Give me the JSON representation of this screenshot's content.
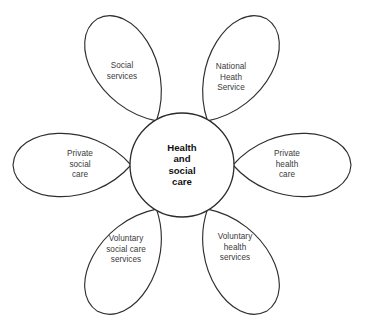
{
  "diagram": {
    "type": "petal-flower",
    "canvas": {
      "width": 365,
      "height": 317
    },
    "colors": {
      "background": "#ffffff",
      "stroke": "#2f2f2f",
      "core_stroke": "#2b2b2b",
      "petal_text": "#3a3a3a",
      "core_text": "#111111"
    },
    "core": {
      "label": "Health\nand\nsocial\ncare",
      "cx": 182,
      "cy": 165,
      "r": 52
    },
    "petals": [
      {
        "id": "social-services",
        "label": "Social\nservices",
        "angle_deg": 240,
        "label_x": 122,
        "label_y": 72,
        "length": 118,
        "width": 62
      },
      {
        "id": "national-heath-service",
        "label": "National\nHeath\nService",
        "angle_deg": 300,
        "label_x": 231,
        "label_y": 78,
        "length": 118,
        "width": 62
      },
      {
        "id": "private-social-care",
        "label": "Private\nsocial\ncare",
        "angle_deg": 180,
        "label_x": 80,
        "label_y": 165,
        "length": 118,
        "width": 62
      },
      {
        "id": "private-health-care",
        "label": "Private\nhealth\ncare",
        "angle_deg": 0,
        "label_x": 287,
        "label_y": 165,
        "length": 118,
        "width": 62
      },
      {
        "id": "voluntary-social-care-services",
        "label": "Voluntary\nsocial care\nservices",
        "angle_deg": 120,
        "label_x": 126,
        "label_y": 250,
        "length": 118,
        "width": 62
      },
      {
        "id": "voluntary-health-services",
        "label": "Voluntary\nhealth\nservices",
        "angle_deg": 60,
        "label_x": 235,
        "label_y": 248,
        "length": 118,
        "width": 62
      }
    ]
  }
}
